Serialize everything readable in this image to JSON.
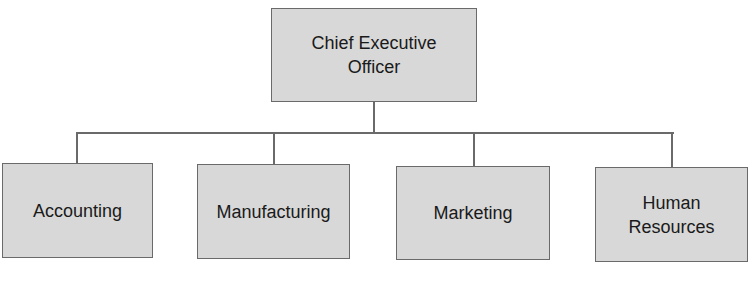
{
  "chart": {
    "root": {
      "label": "Chief Executive Officer",
      "line1": "Chief Executive",
      "line2": "Officer"
    },
    "children": [
      {
        "label": "Accounting"
      },
      {
        "label": "Manufacturing"
      },
      {
        "label": "Marketing"
      },
      {
        "label": "Human Resources",
        "line1": "Human",
        "line2": "Resources"
      }
    ]
  },
  "colors": {
    "box_fill": "#d8d8d8",
    "line": "#6a6a6a",
    "text": "#1a1a1a"
  }
}
